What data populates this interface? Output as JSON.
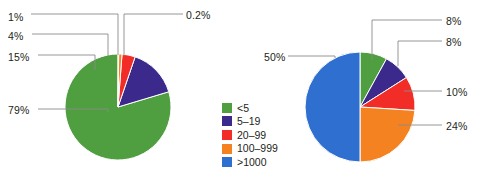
{
  "figure": {
    "background": "#ffffff",
    "width": 477,
    "height": 192
  },
  "legend": {
    "title": "",
    "items": [
      {
        "label": "<5",
        "color": "#4f9e3f"
      },
      {
        "label": "5–19",
        "color": "#3b2a8c"
      },
      {
        "label": "20–99",
        "color": "#f22d28"
      },
      {
        "label": "100–999",
        "color": "#f58220"
      },
      {
        "label": ">1000",
        "color": "#2e6fd0"
      }
    ]
  },
  "chart_data": [
    {
      "type": "pie",
      "name": "left-pie",
      "title": "",
      "categories": [
        "<5",
        "5–19",
        "20–99",
        "100–999",
        ">1000"
      ],
      "values": [
        79,
        15,
        4,
        1,
        0.2
      ],
      "labels": [
        "79%",
        "15%",
        "4%",
        "1%",
        "0.2%"
      ],
      "colors": [
        "#4f9e3f",
        "#3b2a8c",
        "#f22d28",
        "#f58220",
        "#2e6fd0"
      ],
      "start_angle_deg": 0,
      "direction": "counterclockwise",
      "center": [
        118,
        107
      ],
      "radius": 53,
      "legend_position": "center-right"
    },
    {
      "type": "pie",
      "name": "right-pie",
      "title": "",
      "categories": [
        "<5",
        "5–19",
        "20–99",
        "100–999",
        ">1000"
      ],
      "values": [
        8,
        8,
        10,
        24,
        50
      ],
      "labels": [
        "8%",
        "8%",
        "10%",
        "24%",
        "50%"
      ],
      "colors": [
        "#4f9e3f",
        "#3b2a8c",
        "#f22d28",
        "#f58220",
        "#2e6fd0"
      ],
      "start_angle_deg": 0,
      "direction": "clockwise",
      "center": [
        360,
        107
      ],
      "radius": 55,
      "legend_position": "shared"
    }
  ],
  "annotations": {
    "left": [
      {
        "text": "0.2%",
        "x": 186,
        "y": 14
      },
      {
        "text": "1%",
        "x": 8,
        "y": 16
      },
      {
        "text": "4%",
        "x": 8,
        "y": 35
      },
      {
        "text": "15%",
        "x": 8,
        "y": 56
      },
      {
        "text": "79%",
        "x": 8,
        "y": 104
      }
    ],
    "right": [
      {
        "text": "8%",
        "x": 445,
        "y": 15
      },
      {
        "text": "8%",
        "x": 445,
        "y": 36
      },
      {
        "text": "10%",
        "x": 445,
        "y": 86
      },
      {
        "text": "24%",
        "x": 445,
        "y": 120
      },
      {
        "text": "50%",
        "x": 264,
        "y": 51
      }
    ]
  }
}
